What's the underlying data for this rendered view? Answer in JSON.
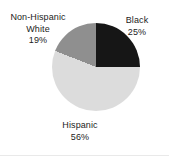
{
  "chart_data": {
    "type": "pie",
    "title": "",
    "subtitle": "",
    "xlabel": "",
    "ylabel": "",
    "legend": "none",
    "grid": false,
    "label_position": "outside",
    "start_angle_deg": 0,
    "direction": "clockwise",
    "categories": [
      "Black",
      "Hispanic",
      "Non-Hispanic White"
    ],
    "values": [
      25,
      56,
      19
    ],
    "unit": "%",
    "total": 100,
    "slices": [
      {
        "name": "Black",
        "value": 25,
        "value_label": "25%",
        "color": "#161616",
        "start_deg": 0,
        "end_deg": 90
      },
      {
        "name": "Hispanic",
        "value": 56,
        "value_label": "56%",
        "color": "#dcdcdc",
        "start_deg": 90,
        "end_deg": 291.6
      },
      {
        "name": "Non-Hispanic White",
        "value": 19,
        "value_label": "19%",
        "color": "#8f8f8f",
        "start_deg": 291.6,
        "end_deg": 360
      }
    ]
  },
  "labels": {
    "black": {
      "name": "Black",
      "percent": "25%"
    },
    "hispanic": {
      "name": "Hispanic",
      "percent": "56%"
    },
    "white": {
      "name_line1": "Non-Hispanic",
      "name_line2": "White",
      "percent": "19%"
    }
  },
  "colors": {
    "background": "#ffffff",
    "text": "#1c1c1c",
    "rule": "#e9e9e9",
    "slice_black": "#161616",
    "slice_light_gray": "#dcdcdc",
    "slice_mid_gray": "#8f8f8f"
  }
}
